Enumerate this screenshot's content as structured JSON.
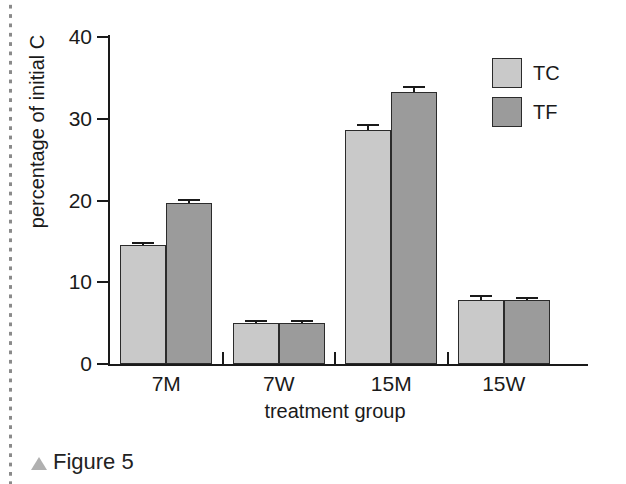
{
  "caption": {
    "marker": "triangle-marker",
    "text": "Figure 5"
  },
  "legend": {
    "position": "top-right",
    "entries": [
      {
        "label": "TC",
        "color": "#c9c9c9"
      },
      {
        "label": "TF",
        "color": "#9b9b9b"
      }
    ]
  },
  "axes": {
    "ylabel": "percentage of initial C",
    "xlabel": "treatment group",
    "yticks": [
      "0",
      "10",
      "20",
      "30",
      "40"
    ]
  },
  "chart_data": {
    "type": "bar",
    "title": "",
    "xlabel": "treatment group",
    "ylabel": "percentage of initial C",
    "ylim": [
      0,
      40
    ],
    "yticks": [
      0,
      10,
      20,
      30,
      40
    ],
    "grid": false,
    "legend_position": "top-right",
    "categories": [
      "7M",
      "7W",
      "15M",
      "15W"
    ],
    "series": [
      {
        "name": "TC",
        "color": "#c9c9c9",
        "values": [
          14.5,
          5.0,
          28.6,
          7.8
        ],
        "errors": [
          0.4,
          0.35,
          0.8,
          0.6
        ]
      },
      {
        "name": "TF",
        "color": "#9b9b9b",
        "values": [
          19.7,
          5.0,
          33.3,
          7.8
        ],
        "errors": [
          0.5,
          0.35,
          0.7,
          0.35
        ]
      }
    ]
  }
}
